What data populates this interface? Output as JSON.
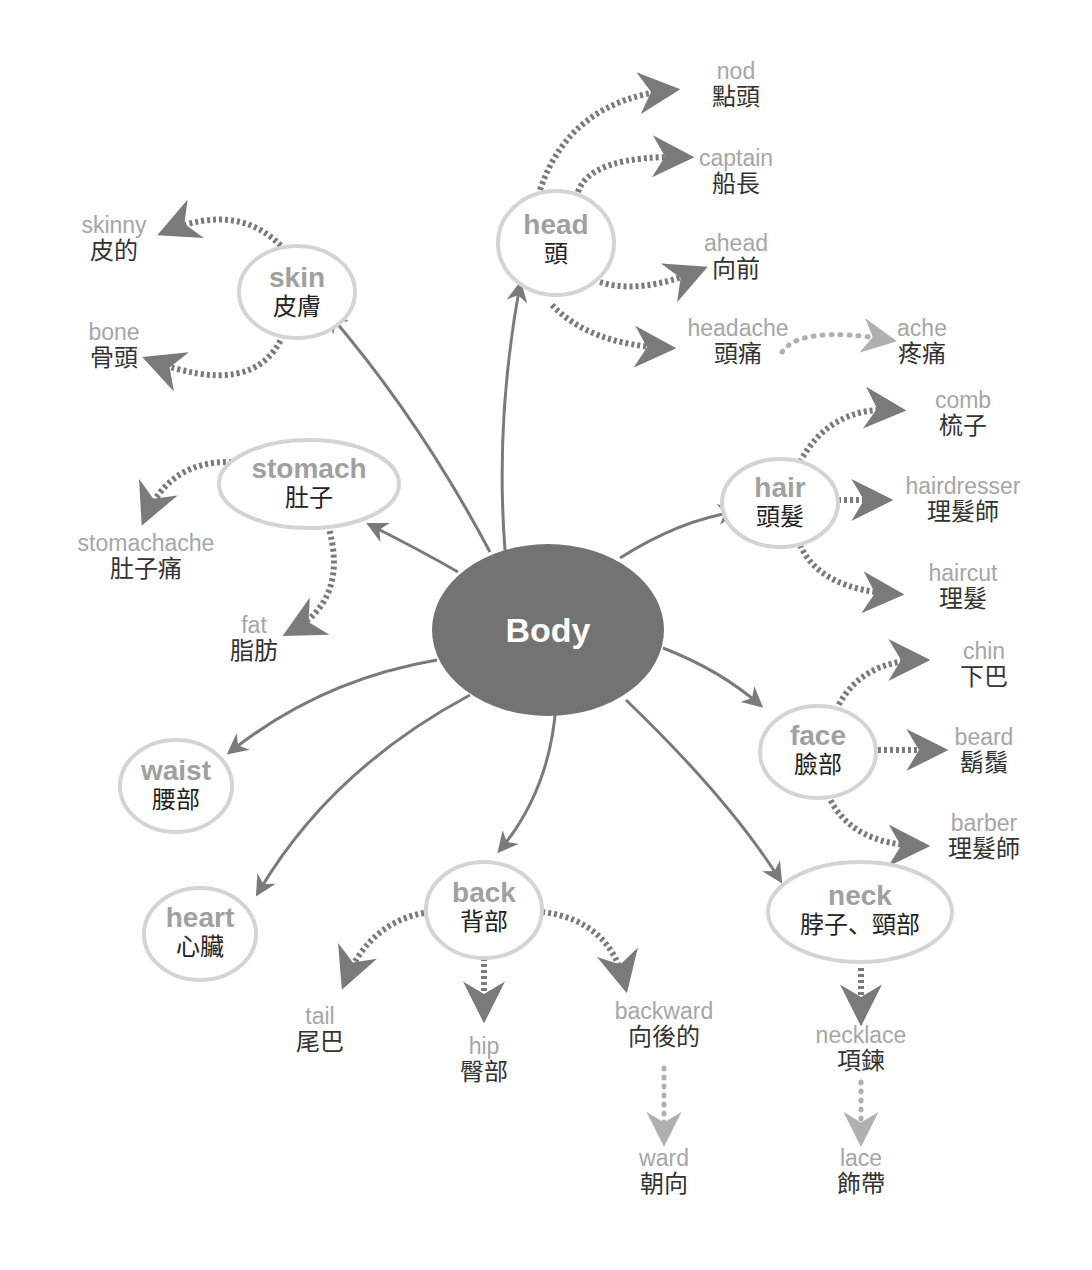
{
  "center": {
    "label": "Body",
    "x": 548,
    "y": 630,
    "color": "#737373"
  },
  "colors": {
    "arrow": "#7a7a7a",
    "light_arrow": "#b0b0b0",
    "ring": "#d4d4d4",
    "english": "#a6a6a6",
    "chinese": "#333333"
  },
  "nodes": [
    {
      "id": "head",
      "en": "head",
      "zh": "頭",
      "x": 556,
      "y": 245
    },
    {
      "id": "skin",
      "en": "skin",
      "zh": "皮膚",
      "x": 297,
      "y": 293
    },
    {
      "id": "stomach",
      "en": "stomach",
      "zh": "肚子",
      "x": 309,
      "y": 485
    },
    {
      "id": "hair",
      "en": "hair",
      "zh": "頭髮",
      "x": 780,
      "y": 503
    },
    {
      "id": "face",
      "en": "face",
      "zh": "臉部",
      "x": 818,
      "y": 753
    },
    {
      "id": "waist",
      "en": "waist",
      "zh": "腰部",
      "x": 176,
      "y": 787
    },
    {
      "id": "heart",
      "en": "heart",
      "zh": "心臟",
      "x": 200,
      "y": 935
    },
    {
      "id": "back",
      "en": "back",
      "zh": "背部",
      "x": 484,
      "y": 910
    },
    {
      "id": "neck",
      "en": "neck",
      "zh": "脖子、頸部",
      "x": 860,
      "y": 913
    }
  ],
  "leaves": [
    {
      "id": "nod",
      "en": "nod",
      "zh": "點頭",
      "x": 736,
      "y": 58
    },
    {
      "id": "captain",
      "en": "captain",
      "zh": "船長",
      "x": 736,
      "y": 145
    },
    {
      "id": "ahead",
      "en": "ahead",
      "zh": "向前",
      "x": 736,
      "y": 230
    },
    {
      "id": "headache",
      "en": "headache",
      "zh": "頭痛",
      "x": 738,
      "y": 315
    },
    {
      "id": "ache",
      "en": "ache",
      "zh": "疼痛",
      "x": 922,
      "y": 315
    },
    {
      "id": "skinny",
      "en": "skinny",
      "zh": "皮的",
      "x": 114,
      "y": 212
    },
    {
      "id": "bone",
      "en": "bone",
      "zh": "骨頭",
      "x": 114,
      "y": 319
    },
    {
      "id": "stomachache",
      "en": "stomachache",
      "zh": "肚子痛",
      "x": 146,
      "y": 530
    },
    {
      "id": "fat",
      "en": "fat",
      "zh": "脂肪",
      "x": 254,
      "y": 612
    },
    {
      "id": "comb",
      "en": "comb",
      "zh": "梳子",
      "x": 963,
      "y": 387
    },
    {
      "id": "hairdresser",
      "en": "hairdresser",
      "zh": "理髮師",
      "x": 963,
      "y": 473
    },
    {
      "id": "haircut",
      "en": "haircut",
      "zh": "理髮",
      "x": 963,
      "y": 560
    },
    {
      "id": "chin",
      "en": "chin",
      "zh": "下巴",
      "x": 984,
      "y": 638
    },
    {
      "id": "beard",
      "en": "beard",
      "zh": "鬍鬚",
      "x": 984,
      "y": 724
    },
    {
      "id": "barber",
      "en": "barber",
      "zh": "理髮師",
      "x": 984,
      "y": 810
    },
    {
      "id": "tail",
      "en": "tail",
      "zh": "尾巴",
      "x": 320,
      "y": 1003
    },
    {
      "id": "hip",
      "en": "hip",
      "zh": "臀部",
      "x": 484,
      "y": 1033
    },
    {
      "id": "backward",
      "en": "backward",
      "zh": "向後的",
      "x": 664,
      "y": 998
    },
    {
      "id": "ward",
      "en": "ward",
      "zh": "朝向",
      "x": 664,
      "y": 1145
    },
    {
      "id": "necklace",
      "en": "necklace",
      "zh": "項鍊",
      "x": 861,
      "y": 1022
    },
    {
      "id": "lace",
      "en": "lace",
      "zh": "飾帶",
      "x": 861,
      "y": 1145
    }
  ]
}
